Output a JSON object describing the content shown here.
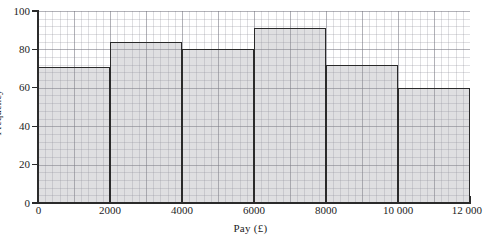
{
  "chart_data": {
    "type": "bar",
    "title": "",
    "xlabel": "Pay (£)",
    "ylabel": "Frequency",
    "categories": [
      "0–2000",
      "2000–4000",
      "4000–6000",
      "6000–8000",
      "8000–10 000",
      "10 000–12 000"
    ],
    "bin_edges": [
      0,
      2000,
      4000,
      6000,
      8000,
      10000,
      12000
    ],
    "values": [
      71,
      84,
      80,
      91,
      72,
      60
    ],
    "xlim": [
      0,
      12000
    ],
    "ylim": [
      0,
      100
    ],
    "x_ticks": [
      0,
      2000,
      4000,
      6000,
      8000,
      10000,
      12000
    ],
    "x_tick_labels": [
      "0",
      "2000",
      "4000",
      "6000",
      "8000",
      "10 000",
      "12 000"
    ],
    "y_ticks": [
      0,
      20,
      40,
      60,
      80,
      100
    ],
    "y_tick_labels": [
      "0",
      "20",
      "40",
      "60",
      "80",
      "100"
    ],
    "grid": "graph-paper",
    "legend": "none",
    "bar_fill_color": "#c9c9cd",
    "bar_edge_color": "#2a2a2a",
    "axis_color": "#2b2b2b",
    "grid_color": "#8c8c96",
    "background_color": "#ffffff"
  }
}
